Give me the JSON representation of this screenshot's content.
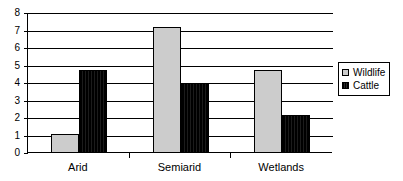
{
  "chart_data": {
    "type": "bar",
    "title": "",
    "xlabel": "",
    "ylabel": "",
    "categories": [
      "Arid",
      "Semiarid",
      "Wetlands"
    ],
    "series": [
      {
        "name": "Wildlife",
        "color": "#cccccc",
        "values": [
          1.1,
          7.2,
          4.75
        ]
      },
      {
        "name": "Cattle",
        "color": "#000000",
        "values": [
          4.75,
          4.0,
          2.2
        ]
      }
    ],
    "ylim": [
      0,
      8
    ],
    "yticks": [
      0,
      1,
      2,
      3,
      4,
      5,
      6,
      7,
      8
    ],
    "ytick_labels": [
      "0",
      "1",
      "2",
      "3",
      "4",
      "5",
      "6",
      "7",
      "8"
    ],
    "grid": true,
    "legend_position": "right",
    "legend_entries": [
      "Wildlife",
      "Cattle"
    ]
  }
}
